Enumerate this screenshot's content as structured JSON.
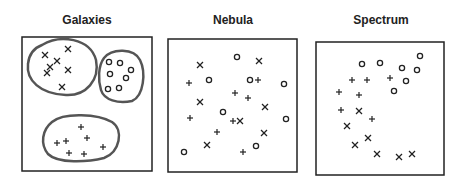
{
  "panels": [
    {
      "title": "Galaxies",
      "box": [
        22,
        37,
        130,
        134
      ],
      "clusters": [
        {
          "shape": "M 42 45 C 60 34, 90 38, 96 60 C 100 80, 86 96, 66 95 C 40 94, 26 80, 28 64 C 29 54, 34 48, 42 45 Z"
        },
        {
          "shape": "M 104 58 C 112 48, 134 48, 140 60 C 146 72, 144 96, 132 101 C 118 104, 104 100, 101 90 C 98 80, 98 66, 104 58 Z"
        },
        {
          "shape": "M 52 122 C 64 112, 98 114, 112 122 C 124 130, 120 152, 104 158 C 88 162, 58 164, 48 154 C 40 144, 42 130, 52 122 Z"
        }
      ],
      "points": [
        {
          "m": "x",
          "x": 45,
          "y": 55
        },
        {
          "m": "x",
          "x": 68,
          "y": 49
        },
        {
          "m": "x",
          "x": 57,
          "y": 61
        },
        {
          "m": "x",
          "x": 50,
          "y": 67
        },
        {
          "m": "x",
          "x": 47,
          "y": 73
        },
        {
          "m": "x",
          "x": 68,
          "y": 70
        },
        {
          "m": "x",
          "x": 62,
          "y": 87
        },
        {
          "m": "o",
          "x": 109,
          "y": 62
        },
        {
          "m": "o",
          "x": 120,
          "y": 63
        },
        {
          "m": "o",
          "x": 110,
          "y": 74
        },
        {
          "m": "o",
          "x": 131,
          "y": 70
        },
        {
          "m": "o",
          "x": 126,
          "y": 78
        },
        {
          "m": "o",
          "x": 108,
          "y": 89
        },
        {
          "m": "o",
          "x": 119,
          "y": 88
        },
        {
          "m": "+",
          "x": 81,
          "y": 127
        },
        {
          "m": "+",
          "x": 87,
          "y": 138
        },
        {
          "m": "+",
          "x": 57,
          "y": 143
        },
        {
          "m": "+",
          "x": 66,
          "y": 141
        },
        {
          "m": "+",
          "x": 103,
          "y": 147
        },
        {
          "m": "+",
          "x": 69,
          "y": 153
        },
        {
          "m": "+",
          "x": 84,
          "y": 154
        }
      ]
    },
    {
      "title": "Nebula",
      "box": [
        168,
        39,
        129,
        133
      ],
      "clusters": [],
      "points": [
        {
          "m": "x",
          "x": 200,
          "y": 65
        },
        {
          "m": "o",
          "x": 237,
          "y": 57
        },
        {
          "m": "x",
          "x": 259,
          "y": 61
        },
        {
          "m": "+",
          "x": 189,
          "y": 83
        },
        {
          "m": "o",
          "x": 209,
          "y": 80
        },
        {
          "m": "o",
          "x": 250,
          "y": 80
        },
        {
          "m": "+",
          "x": 258,
          "y": 80
        },
        {
          "m": "o",
          "x": 284,
          "y": 84
        },
        {
          "m": "+",
          "x": 235,
          "y": 93
        },
        {
          "m": "+",
          "x": 248,
          "y": 98
        },
        {
          "m": "x",
          "x": 200,
          "y": 102
        },
        {
          "m": "x",
          "x": 265,
          "y": 107
        },
        {
          "m": "o",
          "x": 223,
          "y": 112
        },
        {
          "m": "+",
          "x": 190,
          "y": 118
        },
        {
          "m": "+",
          "x": 233,
          "y": 121
        },
        {
          "m": "x",
          "x": 240,
          "y": 121
        },
        {
          "m": "o",
          "x": 286,
          "y": 119
        },
        {
          "m": "+",
          "x": 217,
          "y": 132
        },
        {
          "m": "x",
          "x": 264,
          "y": 133
        },
        {
          "m": "x",
          "x": 207,
          "y": 145
        },
        {
          "m": "o",
          "x": 256,
          "y": 146
        },
        {
          "m": "o",
          "x": 184,
          "y": 152
        },
        {
          "m": "+",
          "x": 243,
          "y": 152
        }
      ]
    },
    {
      "title": "Spectrum",
      "box": [
        316,
        42,
        128,
        133
      ],
      "clusters": [],
      "points": [
        {
          "m": "o",
          "x": 420,
          "y": 56
        },
        {
          "m": "o",
          "x": 362,
          "y": 64
        },
        {
          "m": "o",
          "x": 380,
          "y": 63
        },
        {
          "m": "o",
          "x": 402,
          "y": 68
        },
        {
          "m": "o",
          "x": 417,
          "y": 70
        },
        {
          "m": "+",
          "x": 352,
          "y": 80
        },
        {
          "m": "+",
          "x": 367,
          "y": 80
        },
        {
          "m": "+",
          "x": 390,
          "y": 78
        },
        {
          "m": "o",
          "x": 406,
          "y": 81
        },
        {
          "m": "o",
          "x": 394,
          "y": 91
        },
        {
          "m": "+",
          "x": 339,
          "y": 92
        },
        {
          "m": "+",
          "x": 359,
          "y": 95
        },
        {
          "m": "+",
          "x": 341,
          "y": 110
        },
        {
          "m": "x",
          "x": 359,
          "y": 111
        },
        {
          "m": "+",
          "x": 372,
          "y": 119
        },
        {
          "m": "x",
          "x": 347,
          "y": 126
        },
        {
          "m": "x",
          "x": 368,
          "y": 138
        },
        {
          "m": "x",
          "x": 355,
          "y": 145
        },
        {
          "m": "x",
          "x": 377,
          "y": 154
        },
        {
          "m": "x",
          "x": 399,
          "y": 157
        },
        {
          "m": "x",
          "x": 412,
          "y": 154
        }
      ]
    }
  ],
  "colors": {
    "ink": "#222222",
    "cluster_outline": "#555555",
    "background": "#ffffff"
  }
}
